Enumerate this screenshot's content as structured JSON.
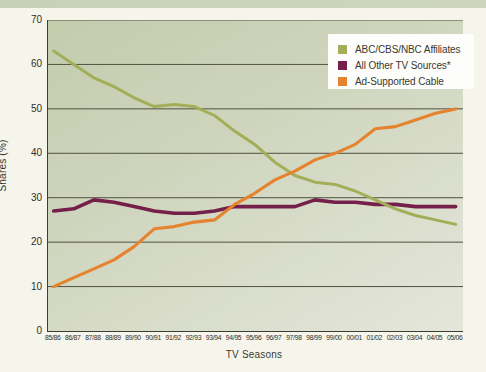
{
  "page": {
    "top_band_color": "#c9d4ba",
    "background_color": "#f6f5ec"
  },
  "chart_data": {
    "type": "line",
    "title": "",
    "xlabel": "TV Seasons",
    "ylabel": "Shares (%)",
    "ylim": [
      0,
      70
    ],
    "yticks": [
      0,
      10,
      20,
      30,
      40,
      50,
      60,
      70
    ],
    "grid": true,
    "legend_position": "top-right",
    "plot_background": "sage-green gradient",
    "gridline_color": "#50513f",
    "categories": [
      "85/86",
      "86/87",
      "87/88",
      "88/89",
      "89/90",
      "90/91",
      "91/92",
      "92/93",
      "93/94",
      "94/95",
      "95/96",
      "96/97",
      "97/98",
      "98/99",
      "99/00",
      "00/01",
      "01/02",
      "02/03",
      "03/04",
      "04/05",
      "05/06"
    ],
    "series": [
      {
        "name": "ABC/CBS/NBC Affiliates",
        "color": "#a4ae58",
        "values": [
          63,
          60,
          57,
          55,
          52.5,
          50.5,
          51,
          50.5,
          48.5,
          45,
          42,
          38,
          35,
          33.5,
          33,
          31.5,
          29.5,
          27.5,
          26,
          25,
          24
        ]
      },
      {
        "name": "All Other TV Sources*",
        "color": "#75204a",
        "values": [
          27,
          27.5,
          29.5,
          29,
          28,
          27,
          26.5,
          26.5,
          27,
          28,
          28,
          28,
          28,
          29.5,
          29,
          29,
          28.5,
          28.5,
          28,
          28,
          28
        ]
      },
      {
        "name": "Ad-Supported Cable",
        "color": "#e5832f",
        "values": [
          10,
          12,
          14,
          16,
          19,
          23,
          23.5,
          24.5,
          25,
          28.5,
          31,
          34,
          36,
          38.5,
          40,
          42,
          45.5,
          46,
          47.5,
          49,
          50
        ]
      }
    ]
  }
}
